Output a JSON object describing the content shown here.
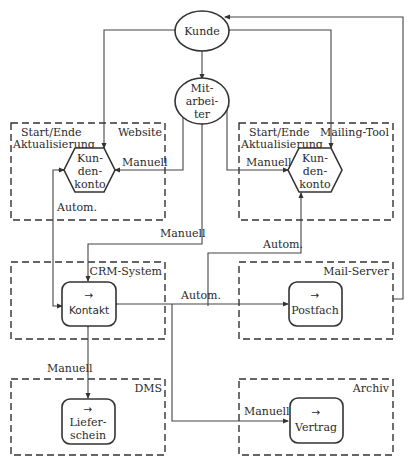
{
  "diagram": {
    "nodes": {
      "kunde": {
        "label": "Kunde",
        "shape": "ellipse"
      },
      "mitarbeiter": {
        "label_lines": [
          "Mit-",
          "arbei-",
          "ter"
        ],
        "shape": "ellipse"
      },
      "kundenkonto_website": {
        "label_lines": [
          "Kun-",
          "den-",
          "konto"
        ],
        "shape": "hexagon"
      },
      "kundenkonto_mailing": {
        "label_lines": [
          "Kun-",
          "den-",
          "konto"
        ],
        "shape": "hexagon"
      },
      "kontakt": {
        "arrow": "→",
        "label": "Kontakt",
        "shape": "rounded-rect"
      },
      "postfach": {
        "arrow": "→",
        "label": "Postfach",
        "shape": "rounded-rect"
      },
      "lieferschein": {
        "arrow": "→",
        "label_lines": [
          "Liefer-",
          "schein"
        ],
        "shape": "rounded-rect"
      },
      "vertrag": {
        "arrow": "→",
        "label": "Vertrag",
        "shape": "rounded-rect"
      }
    },
    "systems": {
      "website": {
        "title": "Website",
        "subtitle_lines": [
          "Start/Ende",
          "Aktualisierung"
        ]
      },
      "mailing_tool": {
        "title": "Mailing-Tool",
        "subtitle_lines": [
          "Start/Ende",
          "Aktualisierung"
        ]
      },
      "crm": {
        "title": "CRM-System"
      },
      "mail_server": {
        "title": "Mail-Server"
      },
      "dms": {
        "title": "DMS"
      },
      "archiv": {
        "title": "Archiv"
      }
    },
    "edge_labels": {
      "website_manuell": "Manuell",
      "website_autom": "Autom.",
      "mailing_manuell": "Manuell",
      "mailing_autom": "Autom.",
      "mitarbeiter_kontakt_manuell": "Manuell",
      "kontakt_postfach_autom": "Autom.",
      "kontakt_lieferschein_manuell": "Manuell",
      "kontakt_vertrag_manuell": "Manuell"
    },
    "edges": [
      {
        "from": "kunde",
        "to": "mitarbeiter",
        "bidirectional": true
      },
      {
        "from": "kunde",
        "to": "kundenkonto_website",
        "bidirectional": true
      },
      {
        "from": "kunde",
        "to": "kundenkonto_mailing",
        "bidirectional": true
      },
      {
        "from": "postfach",
        "to": "kunde"
      },
      {
        "from": "mitarbeiter",
        "to": "kundenkonto_website",
        "label": "Manuell"
      },
      {
        "from": "mitarbeiter",
        "to": "kundenkonto_mailing",
        "label": "Manuell"
      },
      {
        "from": "mitarbeiter",
        "to": "kontakt",
        "label": "Manuell"
      },
      {
        "from": "kundenkonto_website",
        "to": "kontakt",
        "label": "Autom."
      },
      {
        "from": "kontakt",
        "to": "kundenkonto_mailing",
        "label": "Autom."
      },
      {
        "from": "kontakt",
        "to": "postfach",
        "label": "Autom."
      },
      {
        "from": "kontakt",
        "to": "lieferschein",
        "label": "Manuell",
        "bidirectional": true
      },
      {
        "from": "kontakt",
        "to": "vertrag",
        "label": "Manuell"
      }
    ]
  }
}
